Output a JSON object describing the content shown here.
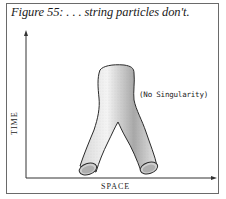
{
  "figure": {
    "caption": "Figure 55: . . . string particles don't.",
    "axes": {
      "y_label": "TIME",
      "x_label": "SPACE"
    },
    "annotation": "(No Singularity)",
    "illustration": "pants-diagram-string-splitting"
  },
  "colors": {
    "frame": "#6a6a6a",
    "axis": "#333333",
    "tube_outline": "#2a2a2a",
    "tube_shade": "#bdbdbd",
    "text": "#1a1a1a"
  }
}
